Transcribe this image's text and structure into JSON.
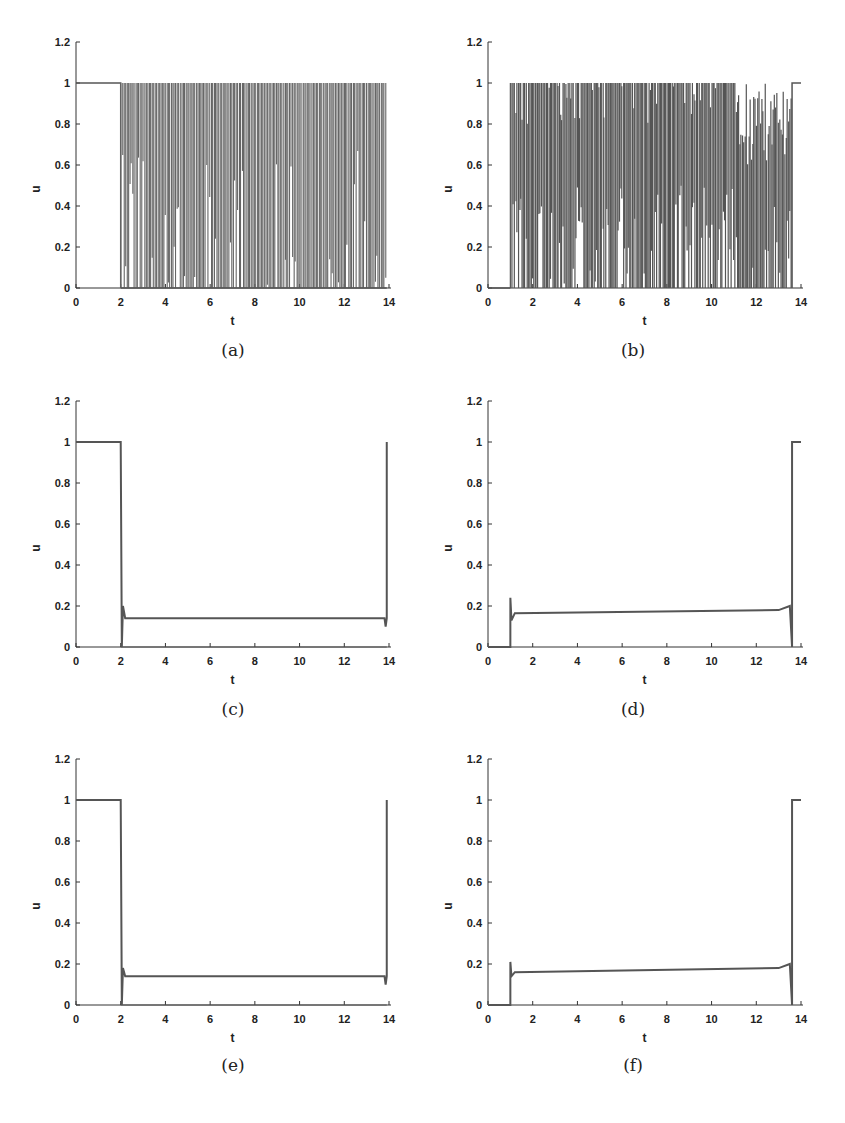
{
  "figure": {
    "panels": [
      {
        "id": "a",
        "caption": "(a)"
      },
      {
        "id": "b",
        "caption": "(b)"
      },
      {
        "id": "c",
        "caption": "(c)"
      },
      {
        "id": "d",
        "caption": "(d)"
      },
      {
        "id": "e",
        "caption": "(e)"
      },
      {
        "id": "f",
        "caption": "(f)"
      }
    ]
  },
  "chart_data": [
    {
      "panel": "(a)",
      "type": "line",
      "title": "",
      "xlabel": "t",
      "ylabel": "u",
      "xlim": [
        0,
        14
      ],
      "ylim": [
        0,
        1.2
      ],
      "xticks": [
        0,
        2,
        4,
        6,
        8,
        10,
        12,
        14
      ],
      "yticks": [
        0,
        0.2,
        0.4,
        0.6,
        0.8,
        1,
        1.2
      ],
      "grid": false,
      "description": "u=1 on [0,2]; from t=2 to ~13.9 rapid bang-bang chattering between 0 and 1 (dense vertical lines); drops to 0 at end",
      "series": [
        {
          "name": "u",
          "x": [
            0,
            2,
            2,
            13.9
          ],
          "values": [
            1,
            1,
            0,
            0
          ],
          "chattering_interval": [
            2,
            13.9
          ],
          "chattering_range": [
            0,
            1
          ]
        }
      ]
    },
    {
      "panel": "(b)",
      "type": "line",
      "title": "",
      "xlabel": "t",
      "ylabel": "u",
      "xlim": [
        0,
        14
      ],
      "ylim": [
        0,
        1.2
      ],
      "xticks": [
        0,
        2,
        4,
        6,
        8,
        10,
        12,
        14
      ],
      "yticks": [
        0,
        0.2,
        0.4,
        0.6,
        0.8,
        1,
        1.2
      ],
      "grid": false,
      "description": "u=0 on [0,1]; dense chattering between 0 and 1 on [1,13.6], envelope lower bound rising to ~0.6 near t=12-13; u=1 on [13.6,14]",
      "series": [
        {
          "name": "u",
          "x": [
            0,
            1,
            1,
            13.6,
            13.6,
            14
          ],
          "values": [
            0,
            0,
            0.8,
            0.6,
            1,
            1
          ],
          "chattering_interval": [
            1,
            13.6
          ],
          "chattering_range": [
            0,
            1
          ]
        }
      ]
    },
    {
      "panel": "(c)",
      "type": "line",
      "title": "",
      "xlabel": "t",
      "ylabel": "u",
      "xlim": [
        0,
        14
      ],
      "ylim": [
        0,
        1.2
      ],
      "xticks": [
        0,
        2,
        4,
        6,
        8,
        10,
        12,
        14
      ],
      "yticks": [
        0,
        0.2,
        0.4,
        0.6,
        0.8,
        1,
        1.2
      ],
      "grid": false,
      "series": [
        {
          "name": "u",
          "x": [
            0,
            2,
            2.05,
            2.1,
            2.2,
            13.8,
            13.85,
            13.9,
            13.9
          ],
          "values": [
            1,
            1,
            0,
            0.2,
            0.14,
            0.14,
            0.1,
            0.14,
            1
          ]
        }
      ]
    },
    {
      "panel": "(d)",
      "type": "line",
      "title": "",
      "xlabel": "t",
      "ylabel": "u",
      "xlim": [
        0,
        14
      ],
      "ylim": [
        0,
        1.2
      ],
      "xticks": [
        0,
        2,
        4,
        6,
        8,
        10,
        12,
        14
      ],
      "yticks": [
        0,
        0.2,
        0.4,
        0.6,
        0.8,
        1,
        1.2
      ],
      "grid": false,
      "series": [
        {
          "name": "u",
          "x": [
            0,
            1,
            1,
            1.05,
            1.2,
            13,
            13.5,
            13.6,
            13.6,
            14
          ],
          "values": [
            0,
            0,
            0.24,
            0.13,
            0.165,
            0.18,
            0.2,
            0,
            1,
            1
          ]
        }
      ]
    },
    {
      "panel": "(e)",
      "type": "line",
      "title": "",
      "xlabel": "t",
      "ylabel": "u",
      "xlim": [
        0,
        14
      ],
      "ylim": [
        0,
        1.2
      ],
      "xticks": [
        0,
        2,
        4,
        6,
        8,
        10,
        12,
        14
      ],
      "yticks": [
        0,
        0.2,
        0.4,
        0.6,
        0.8,
        1,
        1.2
      ],
      "grid": false,
      "series": [
        {
          "name": "u",
          "x": [
            0,
            2,
            2.05,
            2.1,
            2.2,
            13.8,
            13.85,
            13.9,
            13.9
          ],
          "values": [
            1,
            1,
            0,
            0.18,
            0.14,
            0.14,
            0.1,
            0.14,
            1
          ]
        }
      ]
    },
    {
      "panel": "(f)",
      "type": "line",
      "title": "",
      "xlabel": "t",
      "ylabel": "u",
      "xlim": [
        0,
        14
      ],
      "ylim": [
        0,
        1.2
      ],
      "xticks": [
        0,
        2,
        4,
        6,
        8,
        10,
        12,
        14
      ],
      "yticks": [
        0,
        0.2,
        0.4,
        0.6,
        0.8,
        1,
        1.2
      ],
      "grid": false,
      "series": [
        {
          "name": "u",
          "x": [
            0,
            1,
            1,
            1.05,
            1.2,
            13,
            13.5,
            13.6,
            13.6,
            14
          ],
          "values": [
            0,
            0,
            0.21,
            0.14,
            0.16,
            0.18,
            0.2,
            0,
            1,
            1
          ]
        }
      ]
    }
  ]
}
